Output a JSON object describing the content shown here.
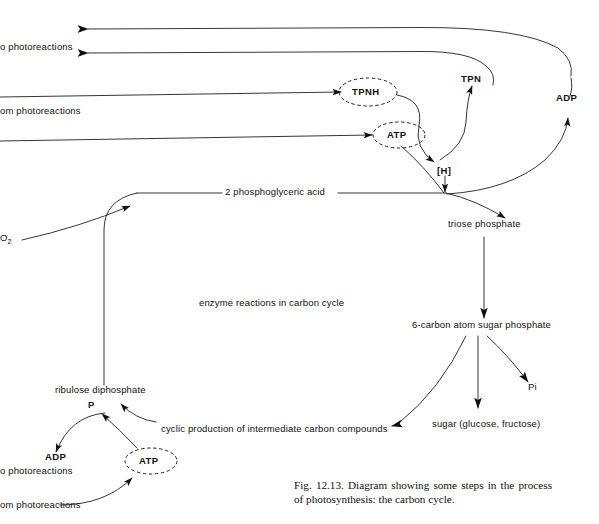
{
  "figure": {
    "caption": "Fig. 12.13. Diagram showing some steps in the process of photosynthesis: the carbon cycle.",
    "center_note": "enzyme reactions in carbon cycle",
    "ink_color": "#111111",
    "background_color": "#ffffff"
  },
  "nodes": {
    "to_photoreactions_top": "o photoreactions",
    "from_photoreactions_top": "om photoreactions",
    "tpnh": "TPNH",
    "atp_top": "ATP",
    "tpn": "TPN",
    "adp_top": "ADP",
    "hydrogen": "[H]",
    "co2": "O",
    "co2_sub": "2",
    "phosphoglyceric_acid": "2 phosphoglyceric acid",
    "triose_phosphate": "triose phosphate",
    "six_carbon_sugar_phosphate": "6-carbon atom sugar phosphate",
    "sugar": "sugar (glucose, fructose)",
    "pi": "Pi",
    "cyclic_production": "cyclic production of intermediate carbon compounds",
    "ribulose_diphosphate": "ribulose diphosphate",
    "phosphate_p": "P",
    "adp_bottom": "ADP",
    "atp_bottom": "ATP",
    "to_photoreactions_bottom": "o photoreactions",
    "from_photoreactions_bottom": "om photoreactions"
  }
}
